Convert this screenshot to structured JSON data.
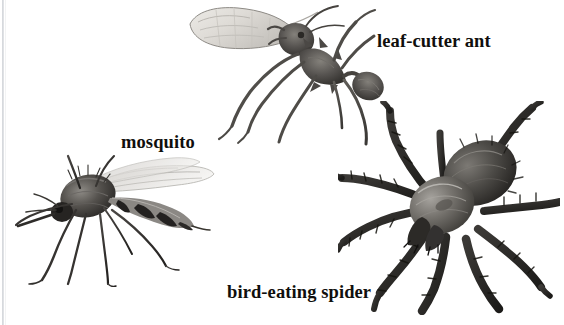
{
  "plate": {
    "title": "arthropod-illustration-plate",
    "background_color": "#ffffff",
    "width": 564,
    "height": 325,
    "style": "black-and-white scanned halftone illustration",
    "artifact": "faint vertical scan line along left edge"
  },
  "labels": [
    {
      "id": "leaf-cutter-ant",
      "text": "leaf-cutter ant",
      "color": "#100f0d",
      "x": 377,
      "y": 31
    },
    {
      "id": "mosquito",
      "text": "mosquito",
      "color": "#100f0d",
      "x": 121,
      "y": 132
    },
    {
      "id": "bird-eating-spider",
      "text": "bird-eating spider",
      "color": "#100f0d",
      "x": 227,
      "y": 282
    }
  ],
  "figures": [
    {
      "id": "leaf-cutter-ant-figure",
      "subject": "leaf-cutter ant carrying a cut leaf fragment in its mandibles",
      "orientation": "body angled diagonally, head upper-left, abdomen lower-right",
      "x": 186,
      "y": 2,
      "width": 200,
      "height": 145,
      "tone_dark": "#3d3b38",
      "tone_mid": "#6e6b66",
      "tone_light": "#d9d7d2"
    },
    {
      "id": "mosquito-figure",
      "subject": "mosquito with banded abdomen and long slender dangling legs",
      "orientation": "facing left, abdomen extending to the right, wings folded back",
      "x": 14,
      "y": 152,
      "width": 205,
      "height": 135,
      "tone_dark": "#2e2c2a",
      "tone_mid": "#6b6865",
      "tone_light": "#cfcdc9"
    },
    {
      "id": "bird-eating-spider-figure",
      "subject": "bird-eating spider (tarantula) viewed from above with eight hairy legs radiating outward",
      "orientation": "dorsal view, carapace center, abdomen upper-right",
      "x": 338,
      "y": 101,
      "width": 222,
      "height": 214,
      "tone_dark": "#242220",
      "tone_mid": "#57544f",
      "tone_light": "#a9a6a1"
    }
  ]
}
